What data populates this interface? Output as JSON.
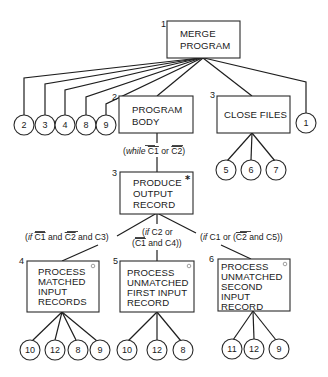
{
  "diagram": {
    "nodes": {
      "merge_program": {
        "number": "1",
        "lines": [
          "MERGE",
          "PROGRAM"
        ]
      },
      "program_body": {
        "number": "2",
        "lines": [
          "PROGRAM",
          "BODY"
        ]
      },
      "close_files": {
        "number": "3",
        "lines": [
          "CLOSE FILES"
        ]
      },
      "produce_output": {
        "number": "3",
        "lines": [
          "PRODUCE",
          "OUTPUT",
          "RECORD"
        ],
        "marker": "*"
      },
      "process_matched": {
        "number": "4",
        "lines": [
          "PROCESS",
          "MATCHED",
          "INPUT",
          "RECORDS"
        ],
        "marker": "o"
      },
      "process_unmatched_first": {
        "number": "5",
        "lines": [
          "PROCESS",
          "UNMATCHED",
          "FIRST INPUT",
          "RECORD"
        ],
        "marker": "o"
      },
      "process_unmatched_second": {
        "number": "6",
        "lines": [
          "PROCESS",
          "UNMATCHED",
          "SECOND",
          "INPUT",
          "RECORD"
        ],
        "marker": "o"
      }
    },
    "operations": {
      "merge_program": [
        "2",
        "3",
        "4",
        "8",
        "9",
        "1"
      ],
      "close_files": [
        "5",
        "6",
        "7"
      ],
      "process_matched": [
        "10",
        "12",
        "8",
        "9"
      ],
      "process_unmatched_first": [
        "10",
        "12",
        "8"
      ],
      "process_unmatched_second": [
        "11",
        "12",
        "9"
      ]
    },
    "conditions": {
      "program_body_iteration": {
        "prefix": "(",
        "keyword": "while",
        "parts": [
          " ",
          "C1",
          " or ",
          "C2",
          ")"
        ],
        "overbar": [
          false,
          true,
          false,
          true,
          false
        ]
      },
      "matched": {
        "prefix": "(",
        "keyword": "if",
        "parts": [
          " ",
          "C1",
          " and ",
          "C2",
          " and C3)"
        ],
        "overbar": [
          false,
          true,
          false,
          true,
          false
        ]
      },
      "unmatched_first_line1": {
        "prefix": "(",
        "keyword": "if",
        "rest": " C2 or"
      },
      "unmatched_first_line2": {
        "parts": [
          "(",
          "C1",
          " and C4))"
        ],
        "overbar": [
          false,
          true,
          false
        ]
      },
      "unmatched_second": {
        "prefix": "(",
        "keyword": "if",
        "parts": [
          " C1 or (",
          "C2",
          " and C5))"
        ],
        "overbar": [
          false,
          true,
          false
        ]
      }
    }
  }
}
